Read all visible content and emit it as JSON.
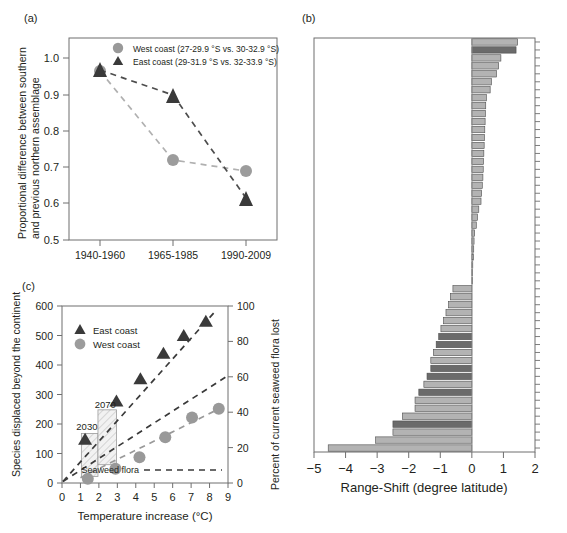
{
  "figure": {
    "panel_a_label": "(a)",
    "panel_b_label": "(b)",
    "panel_c_label": "(c)"
  },
  "colors": {
    "west": "#999999",
    "east": "#3a3a3a",
    "axis": "#6f6f6f",
    "text": "#231f20",
    "bar_light": "#b3b3b3",
    "bar_dark": "#6b6b6b",
    "bar_edge": "#4d4d4d"
  },
  "chart_data": [
    {
      "id": "panel_a",
      "type": "line",
      "title": "(a)",
      "xlabel": "",
      "ylabel": "Proportional difference between southern and previous northern assemblage",
      "categories": [
        "1940-1960",
        "1965-1985",
        "1990-2009"
      ],
      "ylim": [
        0.5,
        1.06
      ],
      "yticks": [
        0.5,
        0.6,
        0.7,
        0.8,
        0.9,
        1.0
      ],
      "ytick_labels": [
        "0.5",
        "0.6",
        "0.7",
        "0.8",
        "0.9",
        "1.0"
      ],
      "grid": false,
      "legend_position": "top-center",
      "series": [
        {
          "name": "West coast (27-29.9 °S vs. 30-32.9 °S)",
          "short": "West coast",
          "marker": "circle",
          "color": "#999999",
          "values": [
            1.0,
            0.755,
            0.725
          ]
        },
        {
          "name": "East coast (29-31.9 °S vs. 32-33.9 °S)",
          "short": "East coast",
          "marker": "triangle",
          "color": "#3a3a3a",
          "values": [
            1.003,
            0.932,
            0.58
          ]
        }
      ]
    },
    {
      "id": "panel_b",
      "type": "bar",
      "orientation": "horizontal",
      "title": "(b)",
      "xlabel": "Range-Shift (degree latitude)",
      "ylabel": "",
      "xlim": [
        -5,
        2
      ],
      "xticks": [
        -5,
        -4,
        -3,
        -2,
        -1,
        0,
        1,
        2
      ],
      "xtick_labels": [
        "−5",
        "−4",
        "−3",
        "−2",
        "−1",
        "0",
        "1",
        "2"
      ],
      "grid": false,
      "categories": [
        "s01",
        "s02",
        "s03",
        "s04",
        "s05",
        "s06",
        "s07",
        "s08",
        "s09",
        "s10",
        "s11",
        "s12",
        "s13",
        "s14",
        "s15",
        "s16",
        "s17",
        "s18",
        "s19",
        "s20",
        "s21",
        "s22",
        "s23",
        "s24",
        "s25",
        "s26",
        "s27",
        "s28",
        "s29",
        "s30",
        "s31",
        "s32",
        "s33",
        "s34",
        "s35",
        "s36",
        "s37",
        "s38",
        "s39",
        "s40",
        "s41",
        "s42",
        "s43",
        "s44",
        "s45",
        "s46",
        "s47",
        "s48",
        "s49",
        "s50",
        "s51",
        "s52"
      ],
      "values": [
        1.45,
        1.4,
        0.92,
        0.85,
        0.78,
        0.62,
        0.58,
        0.46,
        0.44,
        0.43,
        0.42,
        0.41,
        0.4,
        0.39,
        0.38,
        0.37,
        0.36,
        0.35,
        0.33,
        0.31,
        0.29,
        0.22,
        0.18,
        0.14,
        0.09,
        0.07,
        0.06,
        0.05,
        0.03,
        0.02,
        0.0,
        -0.6,
        -0.68,
        -0.74,
        -0.82,
        -0.9,
        -0.98,
        -1.05,
        -1.13,
        -1.22,
        -1.3,
        -1.3,
        -1.42,
        -1.52,
        -1.68,
        -1.8,
        -1.8,
        -2.2,
        -2.5,
        -2.5,
        -3.05,
        -4.55
      ],
      "bar_shades": [
        "light",
        "dark",
        "light",
        "light",
        "light",
        "light",
        "light",
        "light",
        "light",
        "light",
        "light",
        "light",
        "light",
        "light",
        "light",
        "light",
        "light",
        "light",
        "light",
        "light",
        "light",
        "light",
        "light",
        "light",
        "light",
        "light",
        "light",
        "light",
        "light",
        "light",
        "light",
        "light",
        "light",
        "light",
        "light",
        "light",
        "light",
        "dark",
        "dark",
        "light",
        "light",
        "dark",
        "dark",
        "light",
        "dark",
        "light",
        "light",
        "light",
        "dark",
        "light",
        "light",
        "light"
      ]
    },
    {
      "id": "panel_c",
      "type": "scatter",
      "title": "(c)",
      "xlabel": "Temperature increase (°C)",
      "ylabel": "Species displaced beyond the continent",
      "y2label": "Percent of current seaweed flora lost",
      "xlim": [
        0,
        9
      ],
      "ylim": [
        0,
        600
      ],
      "y2lim": [
        0,
        100
      ],
      "xticks": [
        0,
        1,
        2,
        3,
        4,
        5,
        6,
        7,
        8,
        9
      ],
      "xtick_labels": [
        "0",
        "1",
        "2",
        "3",
        "4",
        "5",
        "6",
        "7",
        "8",
        "9"
      ],
      "yticks": [
        0,
        100,
        200,
        300,
        400,
        500,
        600
      ],
      "ytick_labels": [
        "0",
        "100",
        "200",
        "300",
        "400",
        "500",
        "600"
      ],
      "y2ticks": [
        0,
        20,
        40,
        60,
        80,
        100
      ],
      "y2tick_labels": [
        "0",
        "20",
        "40",
        "60",
        "80",
        "100"
      ],
      "grid": false,
      "legend_position": "upper-left",
      "annotations": [
        {
          "text": "2030",
          "x": 1.35,
          "y": 178
        },
        {
          "text": "2070",
          "x": 2.35,
          "y": 255
        },
        {
          "text": "Seaweed flora",
          "x": 5.3,
          "y": 25
        }
      ],
      "series": [
        {
          "name": "East coast",
          "marker": "triangle",
          "color": "#3a3a3a",
          "x": [
            1.25,
            2.95,
            4.25,
            5.5,
            6.6,
            7.8
          ],
          "y": [
            148,
            278,
            353,
            440,
            500,
            548
          ]
        },
        {
          "name": "West coast",
          "marker": "circle",
          "color": "#999999",
          "x": [
            1.4,
            2.9,
            4.2,
            5.6,
            7.05,
            8.5
          ],
          "y": [
            14,
            48,
            87,
            155,
            222,
            252
          ]
        }
      ],
      "trendlines": [
        {
          "name": "east-coast-trend",
          "x0": 0.05,
          "y0": 5,
          "x1": 8.35,
          "y1": 585,
          "color": "#3a3a3a"
        },
        {
          "name": "seaweed-flora-trend",
          "x0": 0.05,
          "y0": 5,
          "x1": 8.95,
          "y1": 362,
          "color": "#3a3a3a"
        },
        {
          "name": "west-coast-trend",
          "x0": 1.0,
          "y0": 18,
          "x1": 8.95,
          "y1": 265,
          "color": "#999999"
        }
      ],
      "boxes": [
        {
          "name": "2030-range-box",
          "x0": 1.05,
          "x1": 1.95,
          "y0": 22,
          "y1": 168
        },
        {
          "name": "2070-range-box",
          "x0": 1.95,
          "x1": 2.95,
          "y0": 62,
          "y1": 248
        }
      ]
    }
  ]
}
